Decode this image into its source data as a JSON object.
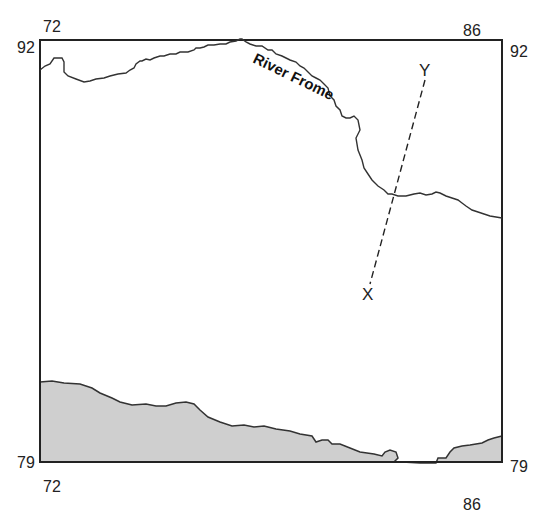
{
  "map": {
    "title_fragment": "",
    "grid": {
      "top_left_easting": "72",
      "top_right_easting": "86",
      "bottom_left_easting": "72",
      "bottom_right_easting": "86",
      "left_top_northing": "92",
      "right_top_northing": "92",
      "left_bottom_northing": "79",
      "right_bottom_northing": "79"
    },
    "features": {
      "river_name": "River Frome",
      "transect_start": "X",
      "transect_end": "Y"
    },
    "colors": {
      "border": "#222222",
      "river": "#333333",
      "sea": "#cfcfcf",
      "coastline": "#333333"
    }
  }
}
